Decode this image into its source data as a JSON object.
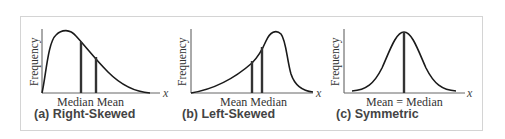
{
  "figure": {
    "panels": [
      {
        "id": "a",
        "caption": "(a) Right-Skewed",
        "y_axis_label": "Frequency",
        "x_axis_label": "x",
        "tick_labels": [
          "Median",
          "Mean"
        ],
        "tick_text": "Median Mean",
        "shape": "right-skewed"
      },
      {
        "id": "b",
        "caption": "(b) Left-Skewed",
        "y_axis_label": "Frequency",
        "x_axis_label": "x",
        "tick_labels": [
          "Mean",
          "Median"
        ],
        "tick_text": "Mean Median",
        "shape": "left-skewed"
      },
      {
        "id": "c",
        "caption": "(c) Symmetric",
        "y_axis_label": "Frequency",
        "x_axis_label": "x",
        "tick_labels": [
          "Mean = Median"
        ],
        "tick_text": "Mean = Median",
        "shape": "symmetric"
      }
    ],
    "colors": {
      "curve": "#1a1a1a",
      "axis": "#555555",
      "marker_line": "#333333",
      "frame_border": "#d4d4d4",
      "caption_text": "#444444"
    }
  }
}
